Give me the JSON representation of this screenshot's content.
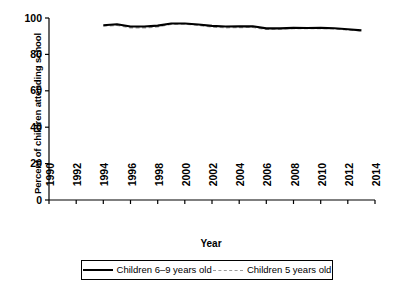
{
  "chart_data": {
    "type": "line",
    "title": "",
    "xlabel": "Year",
    "ylabel": "Percent of children attending school",
    "xlim": [
      1990,
      2014
    ],
    "ylim": [
      0,
      100
    ],
    "xticks": [
      1990,
      1992,
      1994,
      1996,
      1998,
      2000,
      2002,
      2004,
      2006,
      2008,
      2010,
      2012,
      2014
    ],
    "yticks": [
      0,
      20,
      40,
      60,
      80,
      100
    ],
    "grid": false,
    "legend_position": "bottom",
    "x": [
      1994,
      1995,
      1996,
      1997,
      1998,
      1999,
      2000,
      2001,
      2002,
      2003,
      2004,
      2005,
      2006,
      2007,
      2008,
      2009,
      2010,
      2011,
      2012,
      2013
    ],
    "series": [
      {
        "name": "Children 6–9 years old",
        "style": "solid",
        "color": "#000000",
        "values": [
          96.0,
          96.6,
          95.3,
          95.3,
          95.8,
          97.0,
          97.0,
          96.4,
          95.7,
          95.3,
          95.4,
          95.5,
          94.3,
          94.3,
          94.6,
          94.5,
          94.6,
          94.4,
          93.8,
          93.2
        ]
      },
      {
        "name": "Children 5 years old",
        "style": "dashed",
        "color": "#9a9a9a",
        "values": [
          95.6,
          96.0,
          94.7,
          94.6,
          95.2,
          96.6,
          96.7,
          96.0,
          95.1,
          94.7,
          94.8,
          94.9,
          93.8,
          94.0,
          94.3,
          94.2,
          94.3,
          94.1,
          93.5,
          93.0
        ]
      }
    ]
  },
  "axes": {
    "y_title": "Percent of children attending school",
    "x_title": "Year",
    "y_tick_labels": [
      "100",
      "80",
      "60",
      "40",
      "20",
      "0"
    ],
    "x_tick_labels": [
      "1990",
      "1992",
      "1994",
      "1996",
      "1998",
      "2000",
      "2002",
      "2004",
      "2006",
      "2008",
      "2010",
      "2012",
      "2014"
    ]
  },
  "legend": {
    "entries": [
      {
        "label": "Children 6–9 years old",
        "style": "solid"
      },
      {
        "label": "Children 5 years old",
        "style": "dashed"
      }
    ]
  }
}
